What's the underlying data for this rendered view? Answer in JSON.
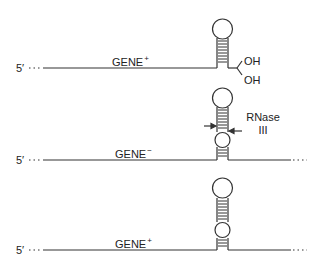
{
  "diagram": {
    "panels": [
      {
        "id": "top",
        "end_label": "5′",
        "gene_label": "GENE",
        "gene_sup": "+",
        "terminus": [
          "OH",
          "OH"
        ],
        "structure": "single stem-loop with 3' diol end"
      },
      {
        "id": "middle",
        "end_label": "5′",
        "gene_label": "GENE",
        "gene_sup": "−",
        "structure": "stem-loop with internal bulge, RNase III cleavage site marked by arrows",
        "enzyme_label_line1": "RNase",
        "enzyme_label_line2": "III",
        "trailing": "..."
      },
      {
        "id": "bottom",
        "end_label": "5′",
        "gene_label": "GENE",
        "gene_sup": "+",
        "structure": "stem-loop with internal bulge, uncleaved",
        "trailing": "..."
      }
    ]
  }
}
